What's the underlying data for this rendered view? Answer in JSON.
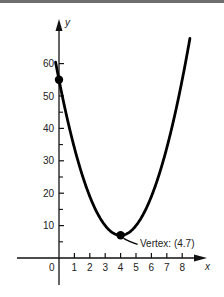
{
  "chart_data": {
    "type": "line",
    "title": "",
    "xlabel": "x",
    "ylabel": "y",
    "function": "y = 3(x - 4)^2 + 7",
    "xlim": [
      -0.6,
      9.2
    ],
    "ylim": [
      -3,
      68
    ],
    "x_ticks": [
      0,
      1,
      2,
      3,
      4,
      5,
      6,
      7,
      8
    ],
    "x_tick_labels": [
      "0",
      "1",
      "2",
      "3",
      "4",
      "5",
      "6",
      "7",
      "8"
    ],
    "y_ticks": [
      10,
      20,
      30,
      40,
      50,
      60
    ],
    "y_tick_labels": [
      "10",
      "20",
      "30",
      "40",
      "50",
      "60"
    ],
    "y_minor_ticks": [
      5,
      15,
      25,
      35,
      45,
      55
    ],
    "grid": false,
    "series": [
      {
        "name": "parabola",
        "x": [
          -0.2,
          0,
          1,
          2,
          3,
          4,
          5,
          6,
          7,
          8,
          8.5
        ],
        "values": [
          59.9,
          55,
          34,
          19,
          10,
          7,
          10,
          19,
          34,
          55,
          61
        ]
      }
    ],
    "points": [
      {
        "x": 0,
        "y": 55,
        "label": ""
      },
      {
        "x": 4,
        "y": 7,
        "label": "Vertex: (4.7)"
      }
    ],
    "annotations": [
      {
        "text": "Vertex: (4.7)",
        "target": {
          "x": 4,
          "y": 7
        }
      }
    ]
  },
  "labels": {
    "x_axis": "x",
    "y_axis": "y",
    "origin": "0",
    "vertex": "Vertex: (4.7)"
  }
}
